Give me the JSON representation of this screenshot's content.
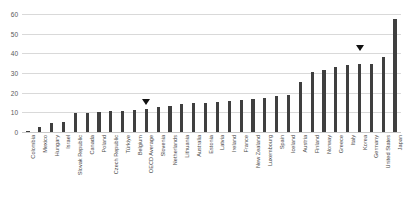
{
  "chart_data": {
    "type": "bar",
    "title": "",
    "xlabel": "",
    "ylabel": "",
    "ylim": [
      0,
      60
    ],
    "yticks": [
      60,
      50,
      40,
      30,
      20,
      10,
      0
    ],
    "grid": true,
    "legend": null,
    "bar_color": "#3f3f3f",
    "marker_color": "#111111",
    "categories": [
      "Colombia",
      "Mexico",
      "Hungary",
      "Israel",
      "Slovak Republic",
      "Canada",
      "Poland",
      "Czech Republic",
      "Türkiye",
      "Belgium",
      "OECD Average",
      "Slovenia",
      "Netherlands",
      "Lithuania",
      "Australia",
      "Estonia",
      "Latvia",
      "Ireland",
      "France",
      "New Zealand",
      "Luxembourg",
      "Spain",
      "Iceland",
      "Austria",
      "Finland",
      "Norway",
      "Greece",
      "Italy",
      "Korea",
      "Germany",
      "United States",
      "Japan"
    ],
    "values": [
      0.3,
      2.4,
      4.6,
      5.2,
      9.6,
      9.7,
      10.1,
      10.6,
      10.8,
      11.0,
      11.8,
      12.9,
      13.2,
      14.1,
      14.9,
      14.9,
      15.5,
      15.9,
      16.1,
      16.6,
      17.3,
      18.1,
      18.9,
      25.3,
      30.6,
      31.4,
      33.3,
      34.1,
      34.4,
      34.6,
      38.1,
      57.5
    ],
    "annotations": [
      {
        "label": "OECD Average",
        "category": "OECD Average",
        "value": 17.0
      },
      {
        "label": "Korea",
        "category": "Korea",
        "value": 44.0
      }
    ]
  }
}
